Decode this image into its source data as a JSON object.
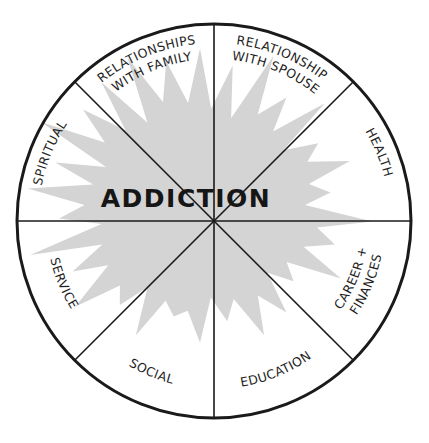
{
  "diagram": {
    "center_label": "ADDICTION",
    "colors": {
      "outline": "#1a1a1a",
      "burst_fill": "#d4d4d4",
      "text": "#1e1e1e",
      "background": "#ffffff"
    },
    "segments": [
      {
        "id": "relationships-with-family",
        "lines": [
          "RELATIONSHIPS",
          "WITH FAMILY"
        ]
      },
      {
        "id": "relationship-with-spouse",
        "lines": [
          "RELATIONSHIP",
          "WITH SPOUSE"
        ]
      },
      {
        "id": "health",
        "lines": [
          "HEALTH"
        ]
      },
      {
        "id": "career-finances",
        "lines": [
          "CAREER +",
          "FINANCES"
        ]
      },
      {
        "id": "education",
        "lines": [
          "EDUCATION"
        ]
      },
      {
        "id": "social",
        "lines": [
          "SOCIAL"
        ]
      },
      {
        "id": "service",
        "lines": [
          "SERVICE"
        ]
      },
      {
        "id": "spiritual",
        "lines": [
          "SPIRITUAL"
        ]
      }
    ]
  }
}
